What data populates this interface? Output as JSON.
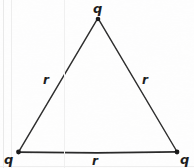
{
  "figure": {
    "kind": "geometry-diagram",
    "background_color": "#fefefe",
    "ink_color": "#1d1d1d",
    "stroke_color": "#262626",
    "vertex_dot_color": "#111111"
  },
  "vertices": [
    {
      "id": "apex",
      "label": "q",
      "x": 98,
      "y": 18,
      "label_x": 98,
      "label_y": 8
    },
    {
      "id": "bottom-left",
      "label": "q",
      "x": 18,
      "y": 152,
      "label_x": 9,
      "label_y": 161
    },
    {
      "id": "bottom-right",
      "label": "q",
      "x": 177,
      "y": 152,
      "label_x": 185,
      "label_y": 161
    }
  ],
  "sides": [
    {
      "id": "left",
      "label": "r",
      "from": "bottom-left",
      "to": "apex",
      "label_x": 47,
      "label_y": 80
    },
    {
      "id": "right",
      "label": "r",
      "from": "apex",
      "to": "bottom-right",
      "label_x": 146,
      "label_y": 80
    },
    {
      "id": "base",
      "label": "r",
      "from": "bottom-left",
      "to": "bottom-right",
      "label_x": 96,
      "label_y": 161
    }
  ],
  "labels": {
    "charge_apex": "q",
    "charge_bottom_left": "q",
    "charge_bottom_right": "q",
    "length_left": "r",
    "length_right": "r",
    "length_base": "r"
  }
}
